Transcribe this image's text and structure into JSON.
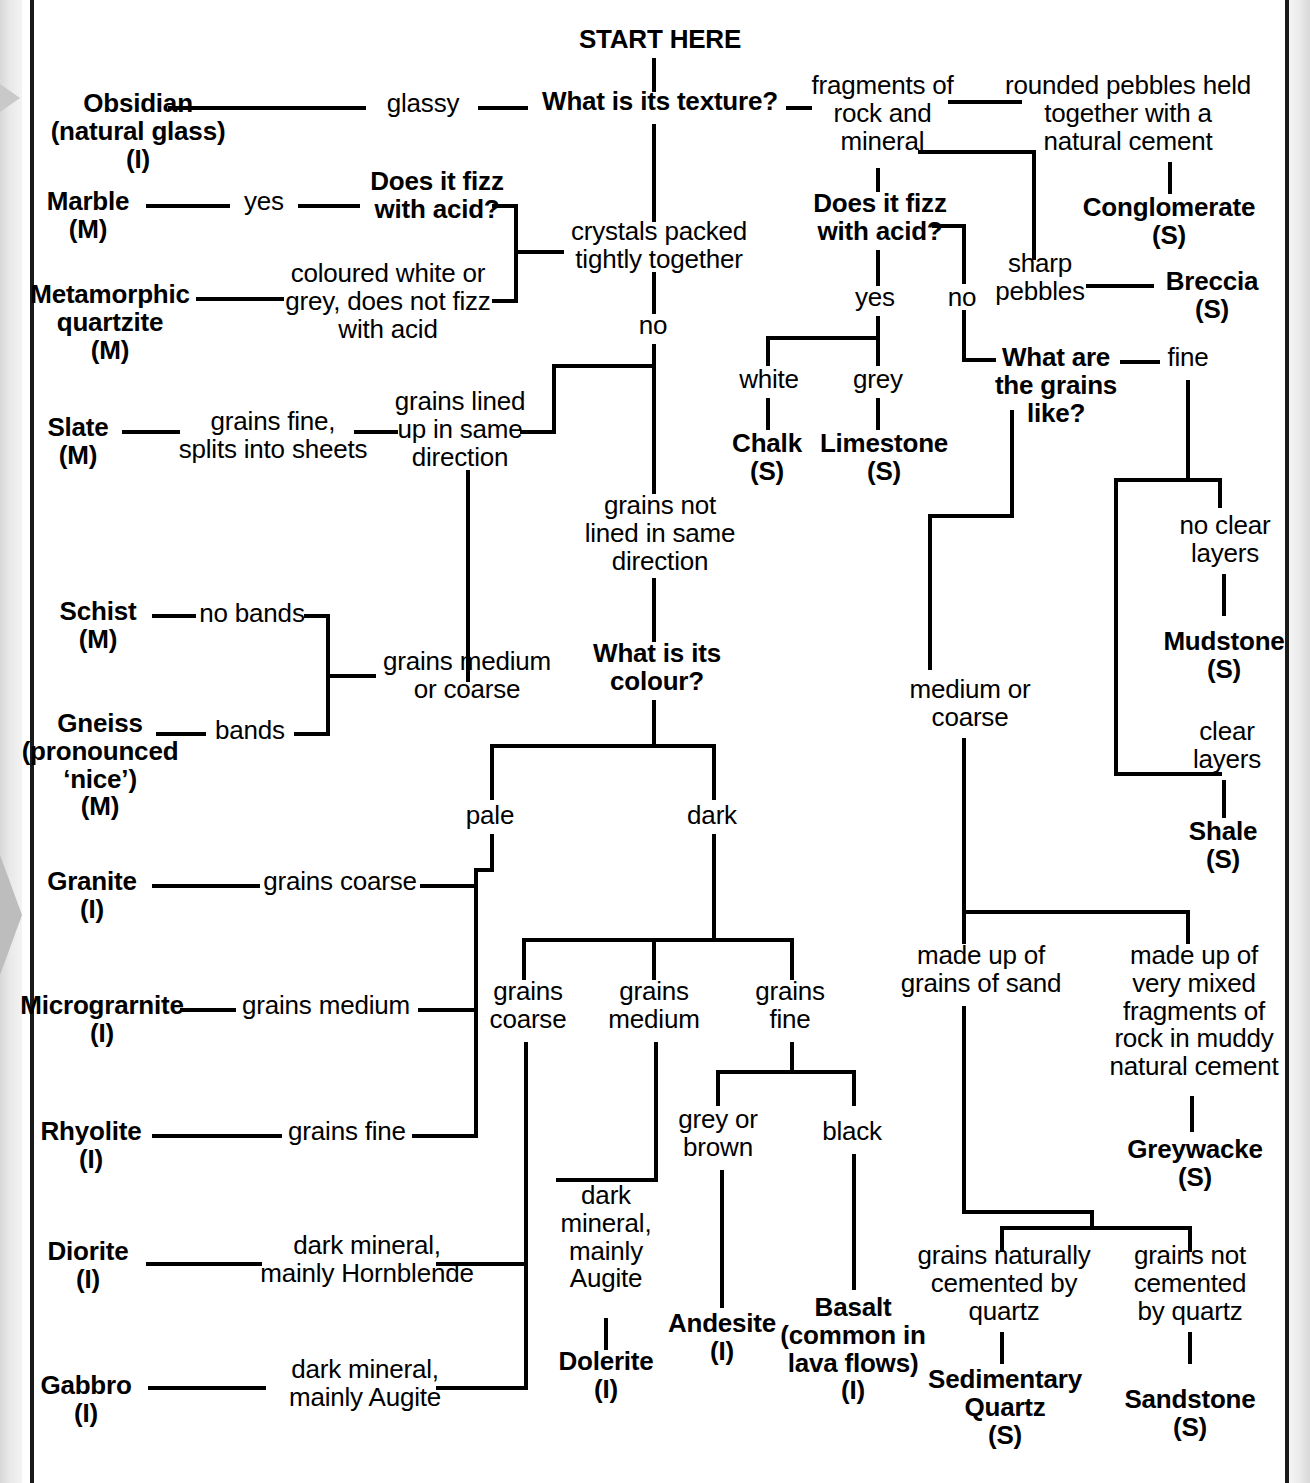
{
  "start": {
    "label": "START HERE"
  },
  "questions": {
    "texture": "What is its texture?",
    "fizz_left": "Does it fizz\nwith acid?",
    "fizz_right": "Does it fizz\nwith acid?",
    "grains_like": "What are\nthe grains\nlike?",
    "colour": "What is its\ncolour?"
  },
  "branch_labels": {
    "glassy": "glassy",
    "crystals_packed": "crystals packed\ntightly together",
    "fragments": "fragments of\nrock and\nmineral",
    "yes_left": "yes",
    "coloured_white_grey": "coloured white or\ngrey, does not fizz\nwith acid",
    "no_center": "no",
    "grains_lined": "grains lined\nup in same\ndirection",
    "grains_not_lined": "grains not\nlined in same\ndirection",
    "grains_fine_splits": "grains fine,\nsplits into sheets",
    "no_bands": "no bands",
    "bands": "bands",
    "grains_medium_coarse": "grains medium\nor coarse",
    "pale": "pale",
    "dark": "dark",
    "grains_coarse_pale": "grains coarse",
    "grains_medium_pale": "grains medium",
    "grains_fine_pale": "grains fine",
    "grains_coarse_dark": "grains\ncoarse",
    "grains_medium_dark": "grains\nmedium",
    "grains_fine_dark": "grains\nfine",
    "dark_mineral_hornblende": "dark mineral,\nmainly Hornblende",
    "dark_mineral_augite": "dark mineral,\nmainly Augite",
    "dark_mineral_augite_2": "dark\nmineral,\nmainly\nAugite",
    "grey_or_brown": "grey or\nbrown",
    "black": "black",
    "yes_right": "yes",
    "no_right": "no",
    "white": "white",
    "grey": "grey",
    "rounded_pebbles": "rounded pebbles held\ntogether with a\nnatural cement",
    "sharp_pebbles": "sharp\npebbles",
    "fine": "fine",
    "medium_or_coarse": "medium or\ncoarse",
    "no_clear_layers": "no clear\nlayers",
    "clear_layers": "clear\nlayers",
    "made_of_sand": "made up of\ngrains of sand",
    "very_mixed": "made up of\nvery mixed\nfragments of\nrock in muddy\nnatural cement",
    "cemented_quartz": "grains naturally\ncemented by\nquartz",
    "not_cemented_quartz": "grains not\ncemented\nby quartz"
  },
  "rocks": {
    "obsidian": "Obsidian\n(natural glass)\n(I)",
    "marble": "Marble\n(M)",
    "metamorphic_quartzite": "Metamorphic\nquartzite\n(M)",
    "slate": "Slate\n(M)",
    "schist": "Schist\n(M)",
    "gneiss": "Gneiss\n(pronounced\n‘nice’)\n(M)",
    "granite": "Granite\n(I)",
    "microgranite": "Micrograrnite\n(I)",
    "rhyolite": "Rhyolite\n(I)",
    "diorite": "Diorite\n(I)",
    "gabbro": "Gabbro\n(I)",
    "dolerite": "Dolerite\n(I)",
    "andesite": "Andesite\n(I)",
    "basalt": "Basalt\n(common in\nlava flows)\n(I)",
    "chalk": "Chalk\n(S)",
    "limestone": "Limestone\n(S)",
    "conglomerate": "Conglomerate\n(S)",
    "breccia": "Breccia\n(S)",
    "mudstone": "Mudstone\n(S)",
    "shale": "Shale\n(S)",
    "greywacke": "Greywacke\n(S)",
    "sedimentary_quartz": "Sedimentary\nQuartz\n(S)",
    "sandstone": "Sandstone\n(S)"
  },
  "colors": {
    "ink": "#000000",
    "paper": "#ffffff",
    "edge_grey": "#d8d8d8"
  }
}
